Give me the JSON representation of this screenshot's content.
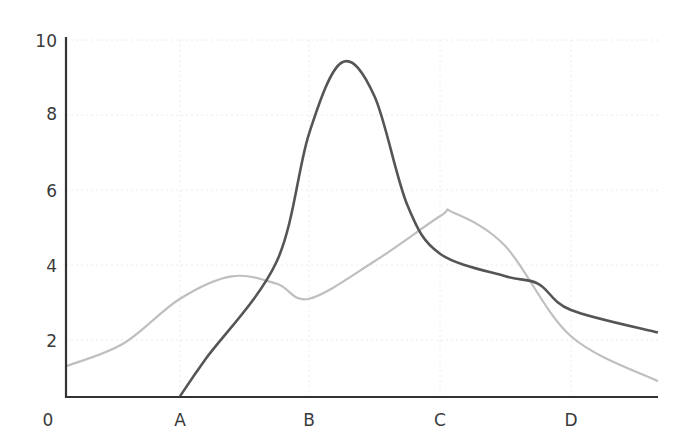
{
  "chart_data": {
    "type": "line",
    "title": "",
    "xlabel": "",
    "ylabel": "",
    "x_ticks": [
      "0",
      "A",
      "B",
      "C",
      "D"
    ],
    "y_ticks": [
      "2",
      "4",
      "6",
      "8",
      "10"
    ],
    "ylim": [
      0.5,
      10
    ],
    "grid": true,
    "legend": null,
    "series": [
      {
        "name": "dark",
        "color": "#555555",
        "points": [
          [
            1.0,
            0.5
          ],
          [
            1.2,
            1.5
          ],
          [
            1.75,
            4.1
          ],
          [
            2.0,
            7.5
          ],
          [
            2.25,
            9.4
          ],
          [
            2.5,
            8.5
          ],
          [
            2.75,
            5.6
          ],
          [
            3.0,
            4.3
          ],
          [
            3.5,
            3.7
          ],
          [
            3.75,
            3.5
          ],
          [
            4.0,
            2.8
          ],
          [
            4.5,
            2.2
          ]
        ]
      },
      {
        "name": "light",
        "color": "#bfbfbf",
        "points": [
          [
            0.0,
            1.3
          ],
          [
            0.5,
            1.9
          ],
          [
            1.0,
            3.1
          ],
          [
            1.4,
            3.7
          ],
          [
            1.75,
            3.5
          ],
          [
            2.0,
            3.1
          ],
          [
            2.5,
            4.1
          ],
          [
            3.0,
            5.3
          ],
          [
            3.1,
            5.4
          ],
          [
            3.5,
            4.5
          ],
          [
            4.0,
            2.1
          ],
          [
            4.5,
            0.9
          ]
        ]
      }
    ]
  },
  "axis": {
    "origin_label": "0",
    "x_labels": [
      {
        "label": "A",
        "x": 180
      },
      {
        "label": "B",
        "x": 309
      },
      {
        "label": "C",
        "x": 440
      },
      {
        "label": "D",
        "x": 571
      }
    ],
    "y_labels": [
      {
        "label": "10",
        "y": 47
      },
      {
        "label": "8",
        "y": 120
      },
      {
        "label": "6",
        "y": 197
      },
      {
        "label": "4",
        "y": 272
      },
      {
        "label": "2",
        "y": 347
      }
    ]
  }
}
